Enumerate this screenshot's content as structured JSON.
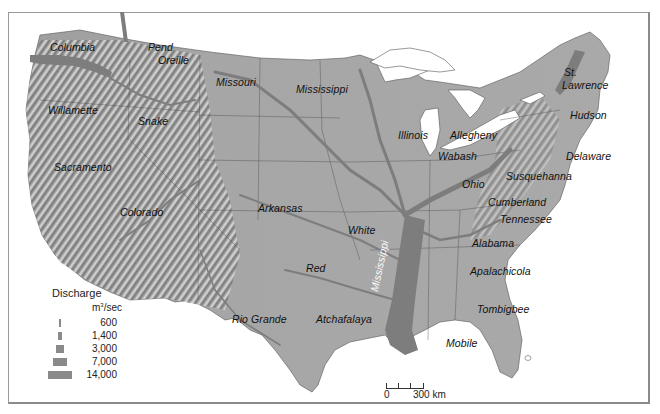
{
  "map": {
    "subject": "Major rivers of the contiguous United States by discharge",
    "colors": {
      "land": "#a8a8a8",
      "river": "#7d7d7d",
      "water": "#ffffff",
      "frame": "#9a9a9a",
      "label": "#111111"
    },
    "rivers": [
      {
        "name": "Columbia"
      },
      {
        "name": "Pend Oreille"
      },
      {
        "name": "Missouri"
      },
      {
        "name": "Mississippi"
      },
      {
        "name": "Willamette"
      },
      {
        "name": "Snake"
      },
      {
        "name": "Sacramento"
      },
      {
        "name": "Colorado"
      },
      {
        "name": "Arkansas"
      },
      {
        "name": "White"
      },
      {
        "name": "Red"
      },
      {
        "name": "Rio Grande"
      },
      {
        "name": "Atchafalaya"
      },
      {
        "name": "Mississippi"
      },
      {
        "name": "Illinois"
      },
      {
        "name": "Allegheny"
      },
      {
        "name": "Wabash"
      },
      {
        "name": "Ohio"
      },
      {
        "name": "St. Lawrence"
      },
      {
        "name": "Hudson"
      },
      {
        "name": "Delaware"
      },
      {
        "name": "Susquehanna"
      },
      {
        "name": "Cumberland"
      },
      {
        "name": "Tennessee"
      },
      {
        "name": "Alabama"
      },
      {
        "name": "Apalachicola"
      },
      {
        "name": "Tombigbee"
      },
      {
        "name": "Mobile"
      }
    ],
    "labels": {
      "columbia": "Columbia",
      "pend": "Pend",
      "oreille": "Oreille",
      "missouri": "Missouri",
      "mississippi_north": "Mississippi",
      "willamette": "Willamette",
      "snake": "Snake",
      "sacramento": "Sacramento",
      "colorado": "Colorado",
      "arkansas": "Arkansas",
      "white": "White",
      "red": "Red",
      "rio_grande": "Rio Grande",
      "atchafalaya": "Atchafalaya",
      "mississippi_main": "Mississippi",
      "illinois": "Illinois",
      "allegheny": "Allegheny",
      "wabash": "Wabash",
      "ohio": "Ohio",
      "st": "St.",
      "lawrence": "Lawrence",
      "hudson": "Hudson",
      "delaware": "Delaware",
      "susquehanna": "Susquehanna",
      "cumberland": "Cumberland",
      "tennessee": "Tennessee",
      "alabama": "Alabama",
      "apalachicola": "Apalachicola",
      "tombigbee": "Tombigbee",
      "mobile": "Mobile"
    }
  },
  "legend": {
    "title": "Discharge",
    "unit_prefix": "m",
    "unit_sup": "3",
    "unit_suffix": "/sec",
    "items": [
      {
        "value": "600",
        "bar_width": 2
      },
      {
        "value": "1,400",
        "bar_width": 4
      },
      {
        "value": "3,000",
        "bar_width": 8
      },
      {
        "value": "7,000",
        "bar_width": 13
      },
      {
        "value": "14,000",
        "bar_width": 22
      }
    ]
  },
  "scale_bar": {
    "start": "0",
    "end": "300 km"
  }
}
